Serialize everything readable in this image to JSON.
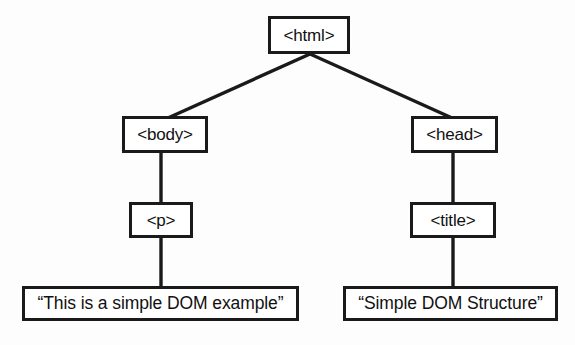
{
  "diagram": {
    "type": "tree",
    "background_color": "#fdfdfd",
    "line_color": "#1a1a1a",
    "node_fill": "#ffffff",
    "nodes": [
      {
        "id": "html",
        "label": "<html>",
        "kind": "element"
      },
      {
        "id": "body",
        "label": "<body>",
        "kind": "element"
      },
      {
        "id": "head",
        "label": "<head>",
        "kind": "element"
      },
      {
        "id": "p",
        "label": "<p>",
        "kind": "element"
      },
      {
        "id": "title",
        "label": "<title>",
        "kind": "element"
      },
      {
        "id": "text_p",
        "label": "“This is a simple DOM example”",
        "kind": "text"
      },
      {
        "id": "text_title",
        "label": "“Simple DOM Structure”",
        "kind": "text"
      }
    ],
    "edges": [
      {
        "from": "html",
        "to": "body",
        "style": "diagonal"
      },
      {
        "from": "html",
        "to": "head",
        "style": "diagonal"
      },
      {
        "from": "body",
        "to": "p",
        "style": "vertical"
      },
      {
        "from": "head",
        "to": "title",
        "style": "vertical"
      },
      {
        "from": "p",
        "to": "text_p",
        "style": "vertical"
      },
      {
        "from": "title",
        "to": "text_title",
        "style": "vertical"
      }
    ]
  }
}
